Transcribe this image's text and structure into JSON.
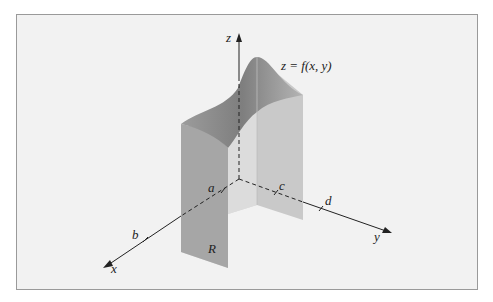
{
  "figure": {
    "title_label": "z = f(x, y)",
    "axes": {
      "x": "x",
      "y": "y",
      "z": "z"
    },
    "ticks": {
      "a": "a",
      "b": "b",
      "c": "c",
      "d": "d"
    },
    "region_label": "R"
  },
  "colors": {
    "background": "#f2f2f2",
    "border": "#9a9a9a",
    "solid_dark": "#a9a9a9",
    "solid_light": "#d0d0d0",
    "axis": "#222222"
  }
}
